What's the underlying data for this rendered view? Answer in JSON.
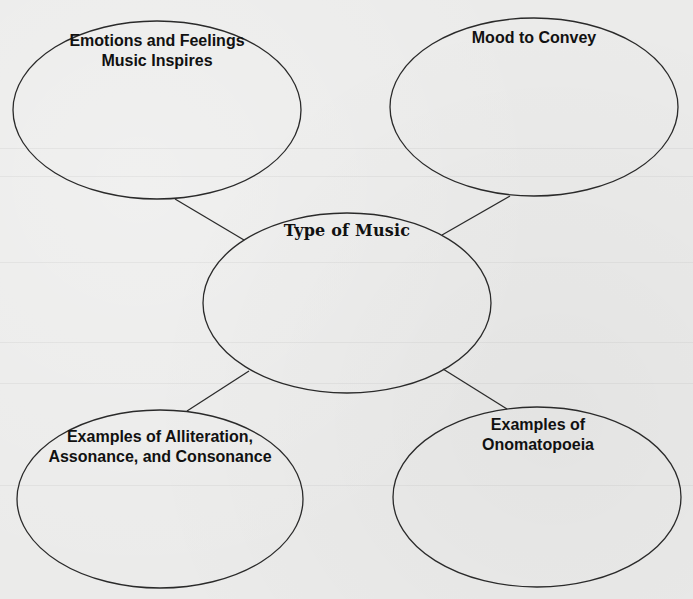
{
  "diagram": {
    "type": "word web / graphic organizer",
    "background_color": "#ebebea",
    "stroke_color": "#2a2a2a",
    "center": {
      "id": "type-of-music",
      "title_lines": [
        "Type of Music"
      ],
      "ellipse": {
        "cx": 347,
        "cy": 303,
        "rx": 144,
        "ry": 90
      }
    },
    "nodes": [
      {
        "id": "emotions-and-feelings",
        "title_lines": [
          "Emotions and Feelings",
          "Music Inspires"
        ],
        "ellipse": {
          "cx": 157,
          "cy": 110,
          "rx": 144,
          "ry": 89
        }
      },
      {
        "id": "mood-to-convey",
        "title_lines": [
          "Mood to Convey"
        ],
        "ellipse": {
          "cx": 534,
          "cy": 107,
          "rx": 144,
          "ry": 89
        }
      },
      {
        "id": "alliteration-assonance-consonance",
        "title_lines": [
          "Examples of Alliteration,",
          "Assonance, and Consonance"
        ],
        "ellipse": {
          "cx": 160,
          "cy": 499,
          "rx": 143,
          "ry": 89
        }
      },
      {
        "id": "onomatopoeia",
        "title_lines": [
          "Examples of",
          "Onomatopoeia"
        ],
        "ellipse": {
          "cx": 537,
          "cy": 497,
          "rx": 144,
          "ry": 90
        }
      }
    ],
    "connectors": [
      {
        "from": "emotions-and-feelings",
        "to": "type-of-music",
        "x1": 175,
        "y1": 199,
        "x2": 244,
        "y2": 240
      },
      {
        "from": "mood-to-convey",
        "to": "type-of-music",
        "x1": 510,
        "y1": 196,
        "x2": 442,
        "y2": 235
      },
      {
        "from": "type-of-music",
        "to": "alliteration-assonance-consonance",
        "x1": 249,
        "y1": 371,
        "x2": 187,
        "y2": 411
      },
      {
        "from": "type-of-music",
        "to": "onomatopoeia",
        "x1": 443,
        "y1": 369,
        "x2": 507,
        "y2": 409
      }
    ]
  }
}
